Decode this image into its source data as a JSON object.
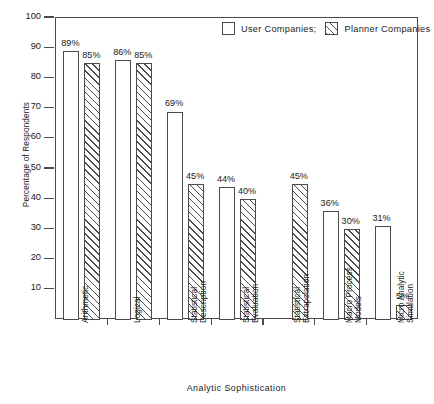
{
  "chart_data": {
    "type": "bar",
    "title": "",
    "xlabel": "Analytic Sophistication",
    "ylabel": "Percentage of Respondents",
    "ylim": [
      0,
      100
    ],
    "yticks": [
      10,
      20,
      30,
      40,
      50,
      60,
      70,
      80,
      90,
      100
    ],
    "ytick_labels": [
      "10",
      "20",
      "30",
      "40",
      "50",
      "60",
      "70",
      "80",
      "90",
      "100"
    ],
    "grid": false,
    "legend_position": "top-right",
    "categories": [
      "Arithmetic",
      "Logical",
      "Statistical Description",
      "Statistical Evaluation",
      "Statistical Extrapolation",
      "Macro Process Models",
      "Micro Analytic Simulation"
    ],
    "category_lines": [
      [
        "Arithmetic",
        ""
      ],
      [
        "Logical",
        ""
      ],
      [
        "Statistical",
        "Description"
      ],
      [
        "Statistical",
        "Evaluation"
      ],
      [
        "Statistical",
        "Extrapolation"
      ],
      [
        "Macro Process",
        "Models"
      ],
      [
        "Micro Analytic",
        "Simulation"
      ]
    ],
    "series": [
      {
        "name": "User Companies;",
        "style": "open",
        "values": [
          89,
          86,
          69,
          44,
          0,
          36,
          31
        ],
        "labels": [
          "89%",
          "86%",
          "69%",
          "44%",
          "",
          "36%",
          "31%"
        ]
      },
      {
        "name": "Planner Companies",
        "style": "hatched",
        "values": [
          85,
          85,
          45,
          40,
          45,
          30,
          5
        ],
        "labels": [
          "85%",
          "85%",
          "45%",
          "40%",
          "45%",
          "30%",
          "5%"
        ]
      }
    ]
  },
  "legend": {
    "items": [
      {
        "label": "User Companies;",
        "style": "open"
      },
      {
        "label": "Planner Companies",
        "style": "hatched"
      }
    ]
  },
  "axes": {
    "y_title": "Percentage of Respondents",
    "x_title": "Analytic Sophistication"
  },
  "colors": {
    "ink": "#4a4a4a",
    "text": "#1a1a1a",
    "background": "#ffffff"
  }
}
